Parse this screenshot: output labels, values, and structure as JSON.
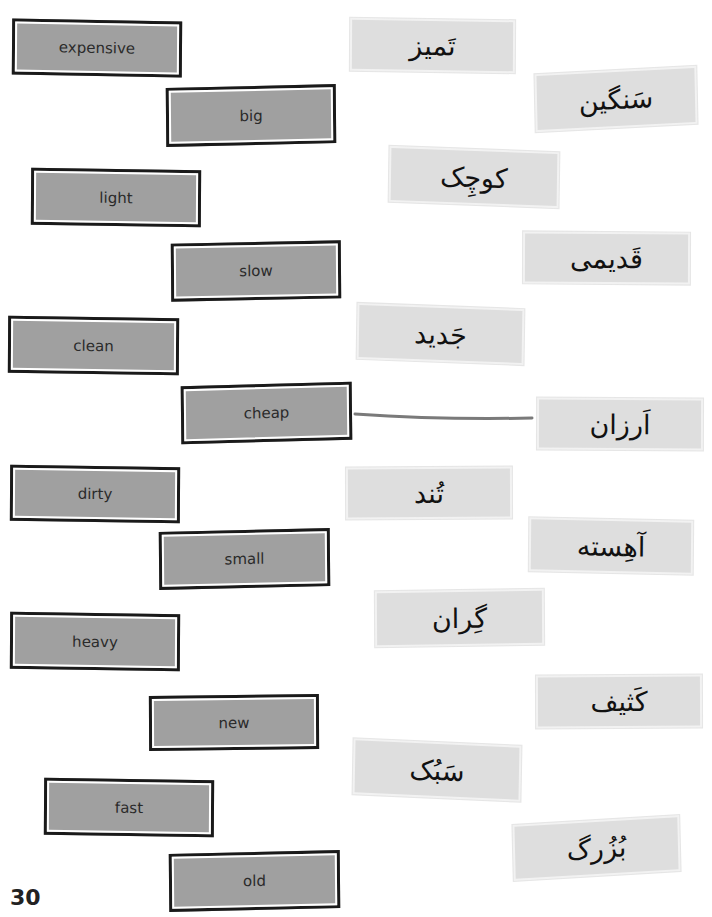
{
  "page_number": "30",
  "english_words": [
    {
      "label": "expensive",
      "x": 12,
      "y": 20,
      "w": 170,
      "h": 56,
      "rot": 1.2
    },
    {
      "label": "big",
      "x": 166,
      "y": 86,
      "w": 170,
      "h": 59,
      "rot": -1.5
    },
    {
      "label": "light",
      "x": 31,
      "y": 169,
      "w": 170,
      "h": 57,
      "rot": 1.0
    },
    {
      "label": "slow",
      "x": 171,
      "y": 242,
      "w": 170,
      "h": 58,
      "rot": -1.3
    },
    {
      "label": "clean",
      "x": 8,
      "y": 317,
      "w": 171,
      "h": 57,
      "rot": 1.0
    },
    {
      "label": "cheap",
      "x": 181,
      "y": 384,
      "w": 171,
      "h": 58,
      "rot": -1.8
    },
    {
      "label": "dirty",
      "x": 10,
      "y": 466,
      "w": 170,
      "h": 56,
      "rot": 1.0
    },
    {
      "label": "small",
      "x": 159,
      "y": 530,
      "w": 171,
      "h": 58,
      "rot": -1.5
    },
    {
      "label": "heavy",
      "x": 10,
      "y": 613,
      "w": 170,
      "h": 57,
      "rot": 1.0
    },
    {
      "label": "new",
      "x": 149,
      "y": 695,
      "w": 170,
      "h": 55,
      "rot": -0.8
    },
    {
      "label": "fast",
      "x": 44,
      "y": 779,
      "w": 170,
      "h": 57,
      "rot": 1.0
    },
    {
      "label": "old",
      "x": 169,
      "y": 852,
      "w": 171,
      "h": 58,
      "rot": -1.5
    }
  ],
  "farsi_words": [
    {
      "label": "تَمیز",
      "x": 350,
      "y": 19,
      "w": 165,
      "h": 53,
      "rot": 1.0
    },
    {
      "label": "سَنگین",
      "x": 535,
      "y": 70,
      "w": 162,
      "h": 58,
      "rot": -3.5
    },
    {
      "label": "کوچِک",
      "x": 389,
      "y": 149,
      "w": 170,
      "h": 56,
      "rot": 2.5
    },
    {
      "label": "قَدیمی",
      "x": 523,
      "y": 232,
      "w": 167,
      "h": 52,
      "rot": 0.5
    },
    {
      "label": "جَدید",
      "x": 357,
      "y": 306,
      "w": 167,
      "h": 56,
      "rot": 2.5
    },
    {
      "label": "اَرزان",
      "x": 537,
      "y": 398,
      "w": 166,
      "h": 52,
      "rot": 0.5
    },
    {
      "label": "تُند",
      "x": 346,
      "y": 467,
      "w": 166,
      "h": 52,
      "rot": -0.5
    },
    {
      "label": "آهِسته",
      "x": 529,
      "y": 519,
      "w": 164,
      "h": 54,
      "rot": 1.5
    },
    {
      "label": "گِران",
      "x": 375,
      "y": 590,
      "w": 169,
      "h": 56,
      "rot": -1.0
    },
    {
      "label": "کَثیف",
      "x": 536,
      "y": 675,
      "w": 166,
      "h": 53,
      "rot": -0.5
    },
    {
      "label": "سَبُک",
      "x": 353,
      "y": 742,
      "w": 168,
      "h": 56,
      "rot": 3.0
    },
    {
      "label": "بُزُرگ",
      "x": 513,
      "y": 820,
      "w": 167,
      "h": 56,
      "rot": -4.0
    }
  ],
  "connections": [
    {
      "from": "cheap",
      "to": "اَرزان",
      "x1": 355,
      "y1": 414,
      "x2": 532,
      "y2": 418,
      "color": "#7a7a7a"
    }
  ]
}
